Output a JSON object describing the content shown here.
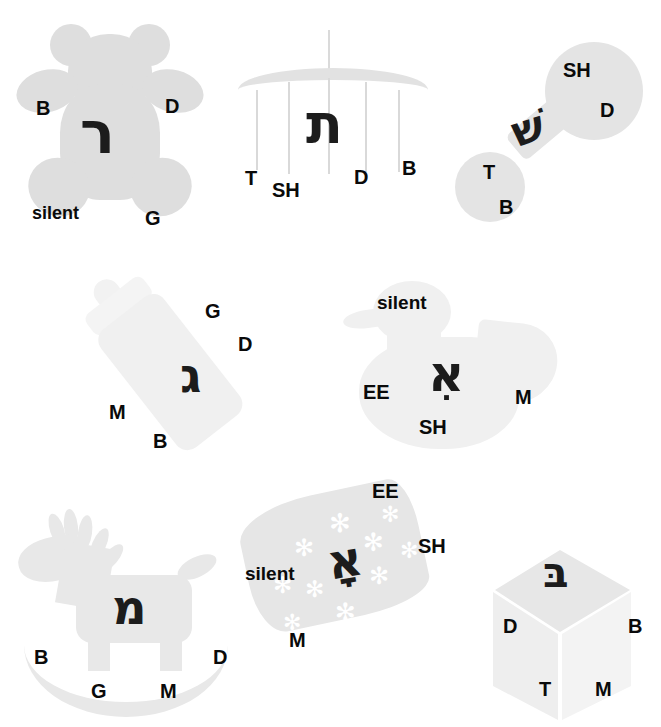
{
  "worksheet": {
    "title": "Find the Letter with the Sound",
    "background_color": "#ffffff",
    "shape_fill": "#dedede",
    "label_color": "#0a0a0a",
    "letter_color": "#1c1c1c"
  },
  "items": [
    {
      "id": "teddy-bear",
      "object": "teddy-bear",
      "hebrew_letter": "ר",
      "hebrew_letter_name": "resh",
      "labels": [
        {
          "text": "B"
        },
        {
          "text": "D"
        },
        {
          "text": "silent"
        },
        {
          "text": "G"
        }
      ]
    },
    {
      "id": "mobile",
      "object": "baby-mobile",
      "hebrew_letter": "ת",
      "hebrew_letter_name": "tav",
      "labels": [
        {
          "text": "T"
        },
        {
          "text": "SH"
        },
        {
          "text": "D"
        },
        {
          "text": "B"
        }
      ]
    },
    {
      "id": "rattle",
      "object": "baby-rattle",
      "hebrew_letter": "שׁ",
      "hebrew_letter_name": "shin",
      "labels": [
        {
          "text": "SH"
        },
        {
          "text": "D"
        },
        {
          "text": "T"
        },
        {
          "text": "B"
        }
      ]
    },
    {
      "id": "bottle",
      "object": "baby-bottle",
      "hebrew_letter": "ג",
      "hebrew_letter_name": "gimel",
      "labels": [
        {
          "text": "G"
        },
        {
          "text": "D"
        },
        {
          "text": "M"
        },
        {
          "text": "B"
        }
      ]
    },
    {
      "id": "duck",
      "object": "rubber-duck",
      "hebrew_letter": "אִ",
      "hebrew_letter_name": "alef",
      "labels": [
        {
          "text": "silent"
        },
        {
          "text": "EE"
        },
        {
          "text": "SH"
        },
        {
          "text": "M"
        }
      ]
    },
    {
      "id": "rocking-horse",
      "object": "rocking-horse",
      "hebrew_letter": "מ",
      "hebrew_letter_name": "mem",
      "labels": [
        {
          "text": "B"
        },
        {
          "text": "D"
        },
        {
          "text": "G"
        },
        {
          "text": "M"
        }
      ]
    },
    {
      "id": "blanket",
      "object": "snowflake-blanket",
      "hebrew_letter": "אָ",
      "hebrew_letter_name": "alef",
      "labels": [
        {
          "text": "EE"
        },
        {
          "text": "SH"
        },
        {
          "text": "silent"
        },
        {
          "text": "M"
        }
      ]
    },
    {
      "id": "block",
      "object": "toy-block-cube",
      "hebrew_letter": "בּ",
      "hebrew_letter_name": "bet",
      "labels": [
        {
          "text": "D"
        },
        {
          "text": "B"
        },
        {
          "text": "T"
        },
        {
          "text": "M"
        }
      ]
    }
  ]
}
